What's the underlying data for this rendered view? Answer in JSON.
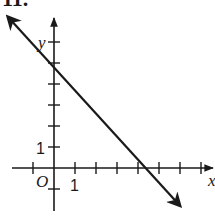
{
  "figure": {
    "label": "11."
  },
  "chart_data": {
    "type": "line",
    "title": "",
    "xlabel": "x",
    "ylabel": "y",
    "origin_label": "O",
    "tick_labels": {
      "x": [
        "1"
      ],
      "y": [
        "1"
      ]
    },
    "xlim": [
      -2,
      7.5
    ],
    "ylim": [
      -2,
      7
    ],
    "x_ticks": [
      -1,
      1,
      2,
      3,
      4,
      5,
      6,
      7
    ],
    "y_ticks": [
      -1,
      1,
      2,
      3,
      4,
      5,
      6
    ],
    "grid": false,
    "legend": null,
    "series": [
      {
        "name": "line",
        "equation": "y = -x + 5",
        "slope": -1,
        "y_intercept": 5,
        "x_intercept": 5,
        "x": [
          -2.2,
          0,
          5,
          6.0
        ],
        "y": [
          7.2,
          5,
          0,
          -1.8
        ],
        "arrows": "both"
      }
    ],
    "colors": {
      "ink": "#1a1a1a",
      "background": "#ffffff"
    }
  }
}
